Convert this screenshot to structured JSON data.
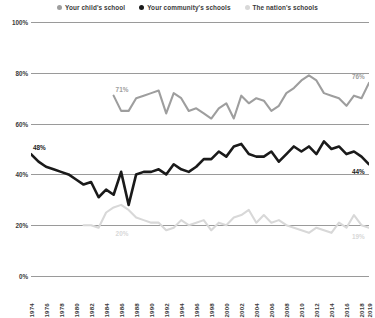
{
  "legend": {
    "position": "top-center",
    "items": [
      {
        "label": "Your child's school",
        "color": "#9e9e9e",
        "marker": "dot"
      },
      {
        "label": "Your community's schools",
        "color": "#1a1a1a",
        "marker": "dot"
      },
      {
        "label": "The nation's schools",
        "color": "#d8d8d8",
        "marker": "dot"
      }
    ]
  },
  "annotations": [
    {
      "text": "48%",
      "series": "Your community's schools",
      "x": 1974,
      "y": 48,
      "color": "#1a1a1a"
    },
    {
      "text": "44%",
      "series": "Your community's schools",
      "x": 2019,
      "y": 44,
      "color": "#1a1a1a"
    },
    {
      "text": "71%",
      "series": "Your child's school",
      "x": 1985,
      "y": 71,
      "color": "#9e9e9e"
    },
    {
      "text": "76%",
      "series": "Your child's school",
      "x": 2019,
      "y": 76,
      "color": "#9e9e9e"
    },
    {
      "text": "20%",
      "series": "The nation's schools",
      "x": 1985,
      "y": 20,
      "color": "#d8d8d8"
    },
    {
      "text": "19%",
      "series": "The nation's schools",
      "x": 2019,
      "y": 19,
      "color": "#d8d8d8"
    }
  ],
  "chart_data": {
    "type": "line",
    "title": "",
    "subtitle": "",
    "xlabel": "",
    "ylabel": "",
    "xlim": [
      1974,
      2019
    ],
    "ylim": [
      0,
      100
    ],
    "yticks": [
      0,
      20,
      40,
      60,
      80,
      100
    ],
    "ytick_labels": [
      "0%",
      "20%",
      "40%",
      "60%",
      "80%",
      "100%"
    ],
    "grid": true,
    "grid_axis": "y",
    "legend_position": "top-center",
    "xticks": [
      1974,
      1976,
      1978,
      1980,
      1982,
      1984,
      1986,
      1988,
      1990,
      1992,
      1994,
      1996,
      1998,
      2000,
      2002,
      2004,
      2006,
      2008,
      2010,
      2012,
      2014,
      2016,
      2018,
      2019
    ],
    "xtick_labels": [
      "1974",
      "1976",
      "1978",
      "1980",
      "1982",
      "1984",
      "1986",
      "1988",
      "1990",
      "1992",
      "1994",
      "1996",
      "1998",
      "2000",
      "2002",
      "2004",
      "2006",
      "2008",
      "2010",
      "2012",
      "2014",
      "2016",
      "2018",
      "2019"
    ],
    "series": [
      {
        "name": "Your child's school",
        "color": "#9e9e9e",
        "width": 2.1,
        "x": [
          1985,
          1986,
          1987,
          1988,
          1989,
          1990,
          1991,
          1992,
          1993,
          1994,
          1995,
          1996,
          1997,
          1998,
          1999,
          2000,
          2001,
          2002,
          2003,
          2004,
          2005,
          2006,
          2007,
          2008,
          2009,
          2010,
          2011,
          2012,
          2013,
          2014,
          2015,
          2016,
          2017,
          2018,
          2019
        ],
        "values": [
          71,
          65,
          65,
          70,
          71,
          72,
          73,
          64,
          72,
          70,
          65,
          66,
          64,
          62,
          66,
          68,
          62,
          71,
          68,
          70,
          69,
          65,
          67,
          72,
          74,
          77,
          79,
          77,
          72,
          71,
          70,
          67,
          71,
          70,
          76
        ]
      },
      {
        "name": "Your community's schools",
        "color": "#1a1a1a",
        "width": 2.6,
        "x": [
          1974,
          1975,
          1976,
          1977,
          1978,
          1979,
          1980,
          1981,
          1982,
          1983,
          1984,
          1985,
          1986,
          1987,
          1988,
          1989,
          1990,
          1991,
          1992,
          1993,
          1994,
          1995,
          1996,
          1997,
          1998,
          1999,
          2000,
          2001,
          2002,
          2003,
          2004,
          2005,
          2006,
          2007,
          2008,
          2009,
          2010,
          2011,
          2012,
          2013,
          2014,
          2015,
          2016,
          2017,
          2018,
          2019
        ],
        "values": [
          48,
          45,
          43,
          42,
          41,
          40,
          38,
          36,
          37,
          31,
          34,
          32,
          41,
          28,
          40,
          41,
          41,
          42,
          40,
          44,
          42,
          41,
          43,
          46,
          46,
          49,
          47,
          51,
          52,
          48,
          47,
          47,
          49,
          45,
          48,
          51,
          49,
          51,
          48,
          53,
          50,
          51,
          48,
          49,
          47,
          44
        ]
      },
      {
        "name": "The nation's schools",
        "color": "#d8d8d8",
        "width": 2.1,
        "x": [
          1981,
          1982,
          1983,
          1984,
          1985,
          1986,
          1987,
          1988,
          1989,
          1990,
          1991,
          1992,
          1993,
          1994,
          1995,
          1996,
          1997,
          1998,
          1999,
          2000,
          2001,
          2002,
          2003,
          2004,
          2005,
          2006,
          2007,
          2008,
          2009,
          2010,
          2011,
          2012,
          2013,
          2014,
          2015,
          2016,
          2017,
          2018,
          2019
        ],
        "values": [
          20,
          20,
          19,
          25,
          27,
          28,
          26,
          23,
          22,
          21,
          21,
          18,
          19,
          22,
          20,
          21,
          22,
          18,
          21,
          20,
          23,
          24,
          26,
          21,
          24,
          21,
          22,
          20,
          19,
          18,
          17,
          19,
          18,
          17,
          21,
          19,
          24,
          20,
          19
        ]
      }
    ]
  }
}
